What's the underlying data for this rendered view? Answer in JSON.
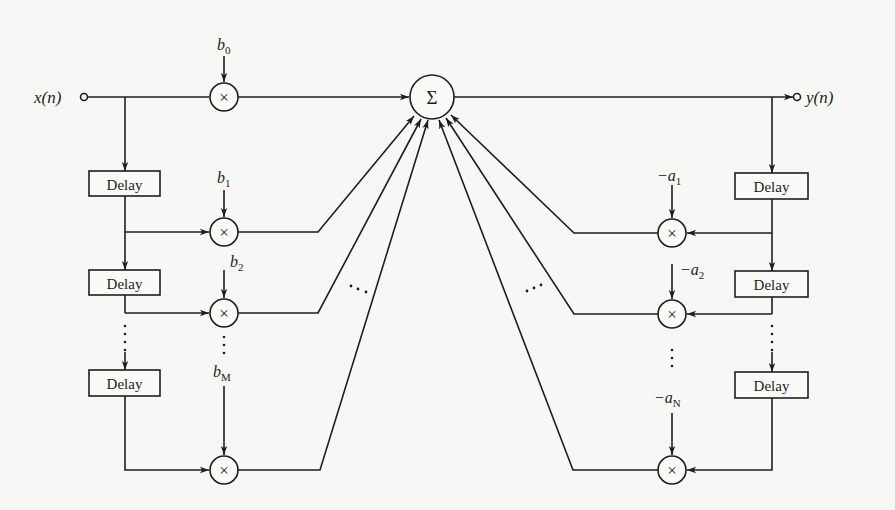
{
  "diagram": {
    "input_label": "x(n)",
    "output_label": "y(n)",
    "sum_symbol": "Σ",
    "multiplier_symbol": "×",
    "delay_label": "Delay",
    "ellipsis_vertical": "⋮",
    "ellipsis_diag": "⋯",
    "feedforward": {
      "coefficients": [
        {
          "base": "b",
          "sub": "0"
        },
        {
          "base": "b",
          "sub": "1"
        },
        {
          "base": "b",
          "sub": "2"
        },
        {
          "base": "b",
          "sub": "M"
        }
      ],
      "delays": [
        "Delay",
        "Delay",
        "Delay"
      ]
    },
    "feedback": {
      "coefficients": [
        {
          "base": "−a",
          "sub": "1"
        },
        {
          "base": "−a",
          "sub": "2"
        },
        {
          "base": "−a",
          "sub": "N"
        }
      ],
      "delays": [
        "Delay",
        "Delay",
        "Delay"
      ]
    }
  },
  "colors": {
    "ink": "#1e1e1e",
    "paper": "#f7f7f5"
  }
}
